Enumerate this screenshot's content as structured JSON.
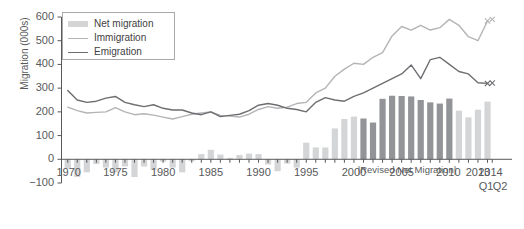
{
  "chart_data": {
    "type": "bar",
    "title": "",
    "xlabel": "",
    "ylabel": "Migration (000s)",
    "ylim": [
      -100,
      600
    ],
    "yticks": [
      -100,
      0,
      100,
      200,
      300,
      400,
      500,
      600
    ],
    "ytick_labels": [
      "−100",
      "0",
      "100",
      "200",
      "300",
      "400",
      "500",
      "600"
    ],
    "xticks": [
      1970,
      1975,
      1980,
      1985,
      1990,
      1995,
      2000,
      2005,
      2010,
      2013,
      2014
    ],
    "xtick_labels": [
      "1970",
      "1975",
      "1980",
      "1985",
      "1990",
      "1995",
      "2000",
      "2005",
      "2010",
      "2013",
      "2014"
    ],
    "quarter_labels": [
      "Q1",
      "Q2"
    ],
    "grid": false,
    "legend_position": "top-left",
    "annotation": "|Revised Net Migration|",
    "x": [
      1970,
      1971,
      1972,
      1973,
      1974,
      1975,
      1976,
      1977,
      1978,
      1979,
      1980,
      1981,
      1982,
      1983,
      1984,
      1985,
      1986,
      1987,
      1988,
      1989,
      1990,
      1991,
      1992,
      1993,
      1994,
      1995,
      1996,
      1997,
      1998,
      1999,
      2000,
      2001,
      2002,
      2003,
      2004,
      2005,
      2006,
      2007,
      2008,
      2009,
      2010,
      2011,
      2012,
      2013,
      2014
    ],
    "series": [
      {
        "name": "Net migration",
        "type": "bar",
        "color": "#d4d5d6",
        "revised_color": "#929497",
        "revised_from": 2001,
        "revised_to": 2010,
        "values": [
          -40,
          -75,
          -55,
          -20,
          -35,
          -55,
          -30,
          -75,
          -30,
          -45,
          -10,
          -35,
          -55,
          -8,
          22,
          40,
          20,
          6,
          18,
          24,
          22,
          -22,
          -50,
          -18,
          -35,
          70,
          50,
          50,
          130,
          170,
          180,
          172,
          155,
          255,
          268,
          267,
          265,
          250,
          240,
          235,
          256,
          205,
          177,
          209,
          243
        ]
      },
      {
        "name": "Immigration",
        "type": "line",
        "color": "#b3b4b6",
        "values": [
          220,
          205,
          195,
          198,
          200,
          218,
          200,
          188,
          192,
          186,
          178,
          170,
          180,
          190,
          195,
          200,
          185,
          182,
          178,
          190,
          210,
          222,
          215,
          220,
          235,
          240,
          280,
          300,
          350,
          380,
          405,
          400,
          430,
          450,
          520,
          560,
          545,
          565,
          545,
          555,
          590,
          565,
          517,
          500,
          583
        ],
        "projected_points": [
          {
            "x": 2014,
            "y": 583,
            "marker": "x"
          },
          {
            "x": 2014.5,
            "y": 590,
            "marker": "x"
          }
        ]
      },
      {
        "name": "Emigration",
        "type": "line",
        "color": "#6d6e71",
        "values": [
          290,
          250,
          240,
          245,
          258,
          265,
          240,
          230,
          222,
          230,
          215,
          208,
          208,
          195,
          188,
          200,
          180,
          185,
          190,
          205,
          228,
          235,
          228,
          215,
          210,
          200,
          240,
          260,
          250,
          245,
          265,
          280,
          300,
          320,
          340,
          360,
          398,
          340,
          420,
          430,
          400,
          370,
          360,
          323,
          320
        ],
        "projected_points": [
          {
            "x": 2014,
            "y": 320,
            "marker": "x"
          },
          {
            "x": 2014.5,
            "y": 322,
            "marker": "x"
          }
        ]
      }
    ]
  },
  "legend": {
    "items": [
      {
        "label": "Net migration",
        "marker": "bar",
        "color": "#d4d5d6"
      },
      {
        "label": "Immigration",
        "marker": "line",
        "color": "#b3b4b6"
      },
      {
        "label": "Emigration",
        "marker": "line",
        "color": "#6d6e71"
      }
    ]
  },
  "axis": {
    "y_title": "Migration (000s)"
  },
  "colors": {
    "axis": "#58595b",
    "text": "#58595b",
    "net_migration": "#d4d5d6",
    "net_migration_revised": "#929497",
    "immigration": "#b3b4b6",
    "emigration": "#6d6e71",
    "legend_border": "#a7a9ac"
  }
}
